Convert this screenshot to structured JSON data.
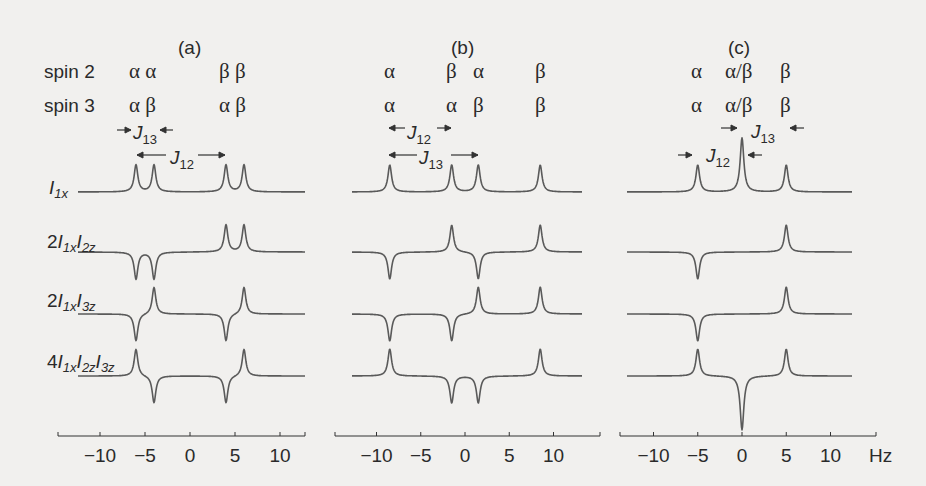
{
  "figure": {
    "panels": [
      {
        "id": "a",
        "title": "(a)",
        "spin2": [
          "α α",
          "β β"
        ],
        "spin3": [
          "α β",
          "α β"
        ],
        "couplings": {
          "J12_label": "J12",
          "J13_label": "J13"
        }
      },
      {
        "id": "b",
        "title": "(b)",
        "spin2": [
          "α",
          "β",
          "α",
          "β"
        ],
        "spin3": [
          "α",
          "α",
          "β",
          "β"
        ],
        "couplings": {
          "J12_label": "J12",
          "J13_label": "J13"
        }
      },
      {
        "id": "c",
        "title": "(c)",
        "spin2": [
          "α",
          "α/β",
          "β"
        ],
        "spin3": [
          "α",
          "α/β",
          "β"
        ],
        "couplings": {
          "J12_label": "J12",
          "J13_label": "J13"
        }
      }
    ],
    "row_labels": {
      "spin2": "spin 2",
      "spin3": "spin 3",
      "r1": "I1x",
      "r2": "2I1xI2z",
      "r3": "2I1xI3z",
      "r4": "4I1xI2zI3z"
    },
    "axis": {
      "ticks": [
        "-10",
        "-5",
        "0",
        "5",
        "10"
      ],
      "unit": "Hz"
    }
  },
  "chart_data": {
    "type": "line",
    "xlabel": "Hz",
    "xlim": [
      -14,
      14
    ],
    "xticks": [
      -10,
      -5,
      0,
      5,
      10
    ],
    "rows": [
      "I1x",
      "2I1xI2z",
      "2I1xI3z",
      "4I1xI2zI3z"
    ],
    "panels": [
      {
        "name": "(a)",
        "J12": 10,
        "J13": 2,
        "peak_positions_hz": [
          -6,
          -4,
          4,
          6
        ],
        "spin2_states": [
          "α",
          "α",
          "β",
          "β"
        ],
        "spin3_states": [
          "α",
          "β",
          "α",
          "β"
        ],
        "series": [
          {
            "name": "I1x",
            "amplitudes": [
              1,
              1,
              1,
              1
            ]
          },
          {
            "name": "2I1xI2z",
            "amplitudes": [
              -1,
              -1,
              1,
              1
            ]
          },
          {
            "name": "2I1xI3z",
            "amplitudes": [
              -1,
              1,
              -1,
              1
            ]
          },
          {
            "name": "4I1xI2zI3z",
            "amplitudes": [
              1,
              -1,
              -1,
              1
            ]
          }
        ]
      },
      {
        "name": "(b)",
        "J12": 7,
        "J13": 10,
        "peak_positions_hz": [
          -8.5,
          -1.5,
          1.5,
          8.5
        ],
        "spin2_states": [
          "α",
          "β",
          "α",
          "β"
        ],
        "spin3_states": [
          "α",
          "α",
          "β",
          "β"
        ],
        "series": [
          {
            "name": "I1x",
            "amplitudes": [
              1,
              1,
              1,
              1
            ]
          },
          {
            "name": "2I1xI2z",
            "amplitudes": [
              -1,
              1,
              -1,
              1
            ]
          },
          {
            "name": "2I1xI3z",
            "amplitudes": [
              -1,
              -1,
              1,
              1
            ]
          },
          {
            "name": "4I1xI2zI3z",
            "amplitudes": [
              1,
              -1,
              -1,
              1
            ]
          }
        ]
      },
      {
        "name": "(c)",
        "J12": 5,
        "J13": 5,
        "peak_positions_hz": [
          -5,
          0,
          5
        ],
        "spin2_states": [
          "α",
          "α/β",
          "β"
        ],
        "spin3_states": [
          "α",
          "α/β",
          "β"
        ],
        "series": [
          {
            "name": "I1x",
            "amplitudes": [
              1,
              2,
              1
            ]
          },
          {
            "name": "2I1xI2z",
            "amplitudes": [
              -1,
              0,
              1
            ]
          },
          {
            "name": "2I1xI3z",
            "amplitudes": [
              -1,
              0,
              1
            ]
          },
          {
            "name": "4I1xI2zI3z",
            "amplitudes": [
              1,
              -2,
              1
            ]
          }
        ]
      }
    ],
    "grid": false,
    "legend": null
  }
}
